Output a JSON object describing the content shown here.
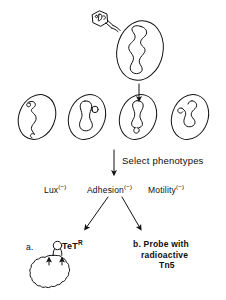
{
  "figure": {
    "style": "hand-drawn line art, black on white",
    "background_color": "#ffffff",
    "line_color": "#111111"
  },
  "top": {
    "vector_name": "transposon-delivery-vector",
    "recipient_name": "recipient-cell-with-chromosome"
  },
  "mutant_row": {
    "count": 4,
    "cells": [
      {
        "id": "mutant-cell-1",
        "insertion_position": "top"
      },
      {
        "id": "mutant-cell-2",
        "insertion_position": "upper-right"
      },
      {
        "id": "mutant-cell-3",
        "insertion_position": "bottom"
      },
      {
        "id": "mutant-cell-4",
        "insertion_position": "left-middle"
      }
    ]
  },
  "steps": {
    "select_phenotypes": "Select phenotypes"
  },
  "phenotypes": [
    {
      "name": "Lux",
      "superscript": "(−)",
      "full": "Lux(−)"
    },
    {
      "name": "Adhesion",
      "superscript": "(−)",
      "full": "Adhesion(−)"
    },
    {
      "name": "Motility",
      "superscript": "(−)",
      "full": "Motility(−)"
    }
  ],
  "branches": {
    "a": {
      "marker": "a.",
      "label": "TeT",
      "superscript": "R",
      "full": "TeT R",
      "graphic": "plasmid-circle-with-insert"
    },
    "b": {
      "marker": "b.",
      "line1": "Probe with",
      "line2": "radioactive",
      "line3": "Tn5",
      "full": "b. Probe with radioactive Tn5"
    }
  },
  "arrows": {
    "vertical_top": "arrow-down-to-mutants",
    "vertical_select": "arrow-down-select-phenotypes",
    "vertical_to_phenotypes": "arrow-down-to-phenotypes",
    "diagonal_left": "arrow-down-left-to-branch-a",
    "diagonal_right": "arrow-down-right-to-branch-b"
  }
}
